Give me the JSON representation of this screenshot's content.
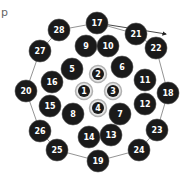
{
  "diagram": {
    "corner_label": "p",
    "colors": {
      "node_fill": "#1a1a1a",
      "node_stroke": "#555555",
      "inner_ring": "#b0b0b0",
      "edge": "#777777",
      "label": "#ffffff"
    },
    "outer_nodes": [
      {
        "id": "17",
        "x": 97,
        "y": 23
      },
      {
        "id": "28",
        "x": 59,
        "y": 30
      },
      {
        "id": "21",
        "x": 136,
        "y": 34
      },
      {
        "id": "22",
        "x": 156,
        "y": 48
      },
      {
        "id": "27",
        "x": 40,
        "y": 51
      },
      {
        "id": "9",
        "x": 86,
        "y": 46
      },
      {
        "id": "10",
        "x": 108,
        "y": 46
      },
      {
        "id": "5",
        "x": 72,
        "y": 69
      },
      {
        "id": "6",
        "x": 122,
        "y": 67
      },
      {
        "id": "16",
        "x": 52,
        "y": 82
      },
      {
        "id": "11",
        "x": 145,
        "y": 80
      },
      {
        "id": "20",
        "x": 26,
        "y": 91
      },
      {
        "id": "18",
        "x": 168,
        "y": 93
      },
      {
        "id": "15",
        "x": 50,
        "y": 106
      },
      {
        "id": "12",
        "x": 145,
        "y": 104
      },
      {
        "id": "8",
        "x": 73,
        "y": 114
      },
      {
        "id": "7",
        "x": 120,
        "y": 114
      },
      {
        "id": "26",
        "x": 40,
        "y": 131
      },
      {
        "id": "23",
        "x": 157,
        "y": 130
      },
      {
        "id": "14",
        "x": 89,
        "y": 137
      },
      {
        "id": "13",
        "x": 111,
        "y": 135
      },
      {
        "id": "25",
        "x": 57,
        "y": 150
      },
      {
        "id": "24",
        "x": 139,
        "y": 150
      },
      {
        "id": "19",
        "x": 98,
        "y": 161
      }
    ],
    "inner_nodes": [
      {
        "id": "2",
        "x": 98,
        "y": 74
      },
      {
        "id": "1",
        "x": 84,
        "y": 91
      },
      {
        "id": "3",
        "x": 113,
        "y": 91
      },
      {
        "id": "4",
        "x": 98,
        "y": 108
      }
    ],
    "perimeter_path": [
      "17",
      "28",
      "27",
      "20",
      "26",
      "25",
      "19",
      "24",
      "23",
      "18",
      "22",
      "21",
      "17"
    ],
    "arrow": {
      "from": [
        97,
        23
      ],
      "to": [
        166,
        34
      ]
    }
  }
}
